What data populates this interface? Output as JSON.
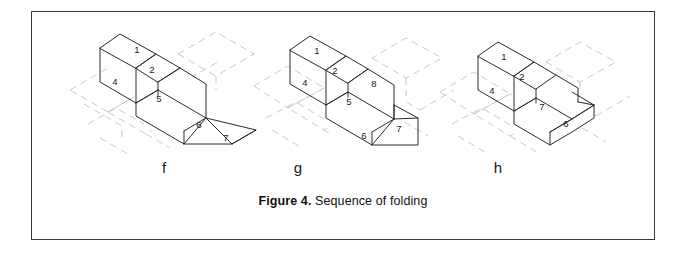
{
  "figure": {
    "caption_label": "Figure 4.",
    "caption_text": " Sequence of folding",
    "border_color": "#3a3a3a",
    "background_color": "#ffffff"
  },
  "panels": [
    {
      "id": "f",
      "sublabel": "f",
      "description": "Partially folded isometric solid with faces 1, 2, 4, 5, 6, 7 and flat unfolded flap extending to lower right",
      "face_numbers": [
        "1",
        "2",
        "4",
        "5",
        "6",
        "7"
      ],
      "ghost_color": "#c9c9c9",
      "edge_color": "#2b2b2b"
    },
    {
      "id": "g",
      "sublabel": "g",
      "description": "Further folded isometric solid with faces 1, 2, 4, 5, 6, 7, 8",
      "face_numbers": [
        "1",
        "2",
        "4",
        "5",
        "8",
        "6",
        "7"
      ],
      "ghost_color": "#c9c9c9",
      "edge_color": "#2b2b2b"
    },
    {
      "id": "h",
      "sublabel": "h",
      "description": "Completed folded stepped block with faces 1, 2, 4, 7, 6",
      "face_numbers": [
        "1",
        "2",
        "4",
        "7",
        "6"
      ],
      "ghost_color": "#c9c9c9",
      "edge_color": "#2b2b2b"
    }
  ],
  "faces_f": [
    {
      "label": "1",
      "x": 77,
      "y": 30
    },
    {
      "label": "2",
      "x": 92,
      "y": 52
    },
    {
      "label": "4",
      "x": 56,
      "y": 68
    },
    {
      "label": "5",
      "x": 96,
      "y": 82
    },
    {
      "label": "6",
      "x": 136,
      "y": 100
    },
    {
      "label": "7",
      "x": 160,
      "y": 117
    }
  ],
  "faces_g": [
    {
      "label": "1",
      "x": 65,
      "y": 30
    },
    {
      "label": "2",
      "x": 80,
      "y": 52
    },
    {
      "label": "4",
      "x": 46,
      "y": 68
    },
    {
      "label": "5",
      "x": 88,
      "y": 78
    },
    {
      "label": "8",
      "x": 116,
      "y": 62
    },
    {
      "label": "6",
      "x": 94,
      "y": 106
    },
    {
      "label": "7",
      "x": 129,
      "y": 96
    }
  ],
  "faces_h": [
    {
      "label": "1",
      "x": 66,
      "y": 36
    },
    {
      "label": "2",
      "x": 82,
      "y": 58
    },
    {
      "label": "4",
      "x": 48,
      "y": 76
    },
    {
      "label": "7",
      "x": 100,
      "y": 76
    },
    {
      "label": "6",
      "x": 118,
      "y": 98
    }
  ]
}
